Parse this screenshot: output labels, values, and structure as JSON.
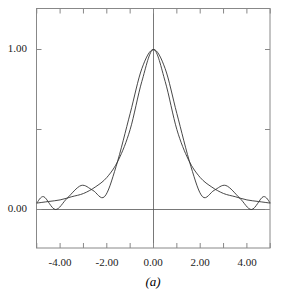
{
  "chart_data": {
    "type": "line",
    "title": "",
    "caption": "(a)",
    "xlabel": "",
    "ylabel": "",
    "xlim": [
      -5,
      5
    ],
    "ylim": [
      -0.25,
      1.25
    ],
    "grid": false,
    "legend": null,
    "x_ticks": [
      "-4.00",
      "-2.00",
      "0.00",
      "2.00",
      "4.00"
    ],
    "y_ticks": [
      "0.00",
      "1.00"
    ],
    "series": [
      {
        "name": "smooth curve",
        "x": [
          -5,
          -4.5,
          -4,
          -3.5,
          -3,
          -2.5,
          -2,
          -1.5,
          -1,
          -0.5,
          0,
          0.5,
          1,
          1.5,
          2,
          2.5,
          3,
          3.5,
          4,
          4.5,
          5
        ],
        "values": [
          0.04,
          0.05,
          0.06,
          0.08,
          0.1,
          0.14,
          0.2,
          0.31,
          0.5,
          0.8,
          1.0,
          0.8,
          0.5,
          0.31,
          0.2,
          0.14,
          0.1,
          0.08,
          0.06,
          0.05,
          0.04
        ]
      },
      {
        "name": "oscillating curve",
        "x": [
          -5,
          -4.7,
          -4.2,
          -3.7,
          -3.1,
          -2.6,
          -2.1,
          -1.6,
          -1,
          -0.5,
          0,
          0.5,
          1,
          1.6,
          2.1,
          2.6,
          3.1,
          3.7,
          4.2,
          4.7,
          5
        ],
        "values": [
          0.04,
          0.08,
          0.0,
          0.07,
          0.15,
          0.12,
          0.08,
          0.27,
          0.6,
          0.88,
          1.0,
          0.88,
          0.6,
          0.27,
          0.08,
          0.12,
          0.15,
          0.07,
          0.0,
          0.08,
          0.04
        ]
      }
    ]
  }
}
